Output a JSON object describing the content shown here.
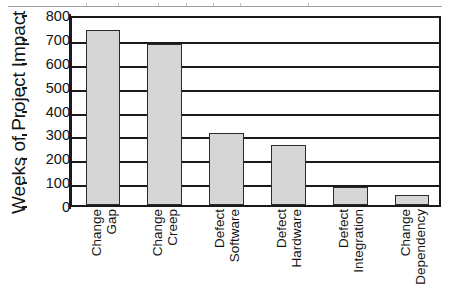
{
  "figure": {
    "artifact_name": "scan-line-artifact"
  },
  "chart_data": {
    "type": "bar",
    "title": "",
    "xlabel": "",
    "ylabel": "Weeks of Project Impact",
    "ylim": [
      0,
      800
    ],
    "ytick_step": 100,
    "yticks": [
      "800",
      "700",
      "600",
      "500",
      "400",
      "300",
      "200",
      "100",
      "0"
    ],
    "grid": true,
    "legend": "none",
    "bar_fill_color": "#d6d6d6",
    "bar_edge_color": "#2b2b2b",
    "axis_color": "#1a1a1a",
    "categories": [
      "Change Gap",
      "Change Creep",
      "Defect Software",
      "Defect Hardware",
      "Defect Integration",
      "Change Dependency"
    ],
    "category_lines": [
      [
        "Change",
        "Gap"
      ],
      [
        "Change",
        "Creep"
      ],
      [
        "Defect",
        "Software"
      ],
      [
        "Defect",
        "Hardware"
      ],
      [
        "Defect",
        "Integration"
      ],
      [
        "Change",
        "Dependency"
      ]
    ],
    "values": [
      735,
      675,
      300,
      250,
      75,
      40
    ]
  }
}
